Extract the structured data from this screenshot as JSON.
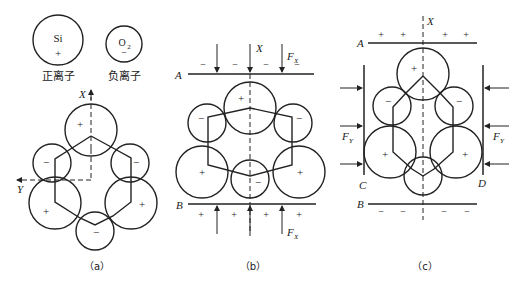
{
  "legend": {
    "positive_ion": {
      "element": "Si",
      "sign": "+",
      "label": "正离子"
    },
    "negative_ion": {
      "element": "O",
      "subscript": "2",
      "sign": "−",
      "label": "负离子"
    }
  },
  "panels": {
    "a": {
      "caption": "（a）",
      "axis_x": "X",
      "axis_y": "Y",
      "ion_signs": {
        "top": "+",
        "upper_left": "−",
        "upper_right": "−",
        "lower_left": "+",
        "lower_right": "+",
        "bottom": "−"
      }
    },
    "b": {
      "caption": "（b）",
      "axis_x": "X",
      "plate_top_label": "A",
      "plate_bottom_label": "B",
      "force_top": "F",
      "force_top_sub": "X",
      "force_bottom": "F",
      "force_bottom_sub": "X",
      "top_charges": [
        "−",
        "−",
        "−",
        "−"
      ],
      "bottom_charges": [
        "+",
        "+",
        "+",
        "+"
      ],
      "ion_signs": {
        "top": "+",
        "upper_left": "−",
        "upper_right": "−",
        "lower_left": "+",
        "lower_right": "+",
        "bottom": "−"
      }
    },
    "c": {
      "caption": "（c）",
      "axis_x": "X",
      "plate_top_label": "A",
      "plate_bottom_label": "B",
      "plate_left_label": "C",
      "plate_right_label": "D",
      "force_left": "F",
      "force_left_sub": "Y",
      "force_right": "F",
      "force_right_sub": "Y",
      "top_charges": [
        "+",
        "+",
        "+",
        "+"
      ],
      "bottom_charges": [
        "−",
        "−",
        "−",
        "−"
      ],
      "ion_signs": {
        "top": "+",
        "upper_left": "−",
        "upper_right": "−",
        "lower_left": "+",
        "lower_right": "+",
        "bottom": "−"
      }
    }
  }
}
